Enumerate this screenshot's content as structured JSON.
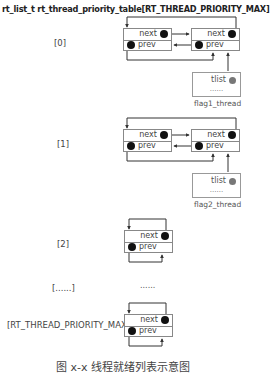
{
  "title": "rt_list_t rt_thread_priority_table[RT_THREAD_PRIORITY_MAX]",
  "node_fields": {
    "next": "next",
    "prev": "prev"
  },
  "thread_fields": {
    "list": "tlist",
    "more": "......"
  },
  "rows": [
    {
      "index_label": "[0]",
      "thread_label": "flag1_thread",
      "has_thread": true
    },
    {
      "index_label": "[1]",
      "thread_label": "flag2_thread",
      "has_thread": true
    },
    {
      "index_label": "[2]",
      "has_thread": false
    },
    {
      "index_label": "[......]",
      "ellipsis": "......"
    },
    {
      "index_label": "[RT_THREAD_PRIORITY_MAX]",
      "has_thread": false
    }
  ],
  "caption": "图 x-x 线程就绪列表示意图",
  "colors": {
    "line": "#333333",
    "box_border": "#888888",
    "dot": "#111111",
    "thread_dot": "#777777"
  }
}
